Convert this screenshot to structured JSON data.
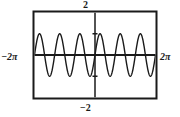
{
  "figure": {
    "kind": "graphing-calculator-plot",
    "title": "",
    "frame": {
      "stroke_color": "#1a1a1a",
      "fill_color": "#ffffff",
      "border_width_px": 2
    }
  },
  "labels": {
    "y_max": "2",
    "y_min": "−2",
    "x_min": "−2π",
    "x_max": "2π"
  },
  "chart_data": {
    "type": "line",
    "title": "",
    "xlabel": "",
    "ylabel": "",
    "xlim": [
      -6.2831853,
      6.2831853
    ],
    "xlim_labels": [
      "−2π",
      "2π"
    ],
    "ylim": [
      -2,
      2
    ],
    "ylim_labels": [
      "−2",
      "2"
    ],
    "grid": false,
    "legend": "none",
    "axes": {
      "x_axis_drawn": true,
      "y_axis_drawn": true,
      "x_axis_y_value": 0,
      "y_axis_x_value": 0,
      "y_ticks": [
        -1,
        1
      ],
      "x_ticks": []
    },
    "series": [
      {
        "name": "y = sin(3x)",
        "color": "#1a1a1a",
        "line_width_px": 1.4,
        "amplitude": 1,
        "cycles_across_window": 6,
        "period": 2.0943951,
        "phase": 0,
        "x": [
          -6.2832,
          -6.1263,
          -5.9694,
          -5.8125,
          -5.6556,
          -5.4987,
          -5.3418,
          -5.1849,
          -5.028,
          -4.8711,
          -4.7124,
          -4.5553,
          -4.3984,
          -4.2415,
          -4.0846,
          -3.9277,
          -3.7708,
          -3.6139,
          -3.457,
          -3.3001,
          -3.1416,
          -2.9845,
          -2.8276,
          -2.6707,
          -2.5138,
          -2.3569,
          -2.2,
          -2.0431,
          -1.8862,
          -1.7293,
          -1.5708,
          -1.4137,
          -1.2568,
          -1.0999,
          -0.943,
          -0.7861,
          -0.6292,
          -0.4723,
          -0.3154,
          -0.1585,
          0.0,
          0.1571,
          0.314,
          0.4709,
          0.6278,
          0.7847,
          0.9416,
          1.0985,
          1.2554,
          1.4123,
          1.5708,
          1.7279,
          1.8848,
          2.0417,
          2.1986,
          2.3555,
          2.5124,
          2.6693,
          2.8262,
          2.9831,
          3.1416,
          3.2987,
          3.4556,
          3.6125,
          3.7694,
          3.9263,
          4.0832,
          4.2401,
          4.397,
          4.5539,
          4.7124,
          4.8695,
          5.0264,
          5.1833,
          5.3402,
          5.4971,
          5.654,
          5.8109,
          5.9678,
          6.1247,
          6.2832
        ],
        "y": [
          0.0,
          0.454,
          0.809,
          0.988,
          0.951,
          0.707,
          0.309,
          -0.156,
          -0.588,
          -0.891,
          -1.0,
          -0.896,
          -0.597,
          -0.168,
          0.297,
          0.698,
          0.947,
          0.991,
          0.823,
          0.482,
          0.0,
          -0.454,
          -0.809,
          -0.988,
          -0.951,
          -0.707,
          -0.309,
          0.156,
          0.588,
          0.891,
          1.0,
          0.896,
          0.597,
          0.168,
          -0.297,
          -0.698,
          -0.947,
          -0.991,
          -0.823,
          -0.482,
          0.0,
          0.454,
          0.809,
          0.988,
          0.951,
          0.707,
          0.309,
          -0.156,
          -0.588,
          -0.891,
          -1.0,
          -0.896,
          -0.597,
          -0.168,
          0.297,
          0.698,
          0.947,
          0.991,
          0.823,
          0.482,
          0.0,
          -0.454,
          -0.809,
          -0.988,
          -0.951,
          -0.707,
          -0.309,
          0.156,
          0.588,
          0.891,
          1.0,
          0.896,
          0.597,
          0.168,
          -0.297,
          -0.698,
          -0.947,
          -0.991,
          -0.823,
          -0.482,
          0.0
        ]
      }
    ]
  }
}
